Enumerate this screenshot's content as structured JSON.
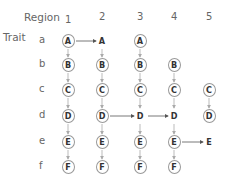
{
  "header": {
    "region_label": "Region",
    "trait_label": "Trait"
  },
  "regions": [
    {
      "label": "1",
      "x": 68
    },
    {
      "label": "2",
      "x": 102
    },
    {
      "label": "3",
      "x": 140
    },
    {
      "label": "4",
      "x": 174
    },
    {
      "label": "5",
      "x": 209
    }
  ],
  "traits": [
    {
      "label": "a",
      "y": 41
    },
    {
      "label": "b",
      "y": 65
    },
    {
      "label": "c",
      "y": 90
    },
    {
      "label": "d",
      "y": 116
    },
    {
      "label": "e",
      "y": 142
    },
    {
      "label": "f",
      "y": 167
    }
  ],
  "nodes": [
    {
      "id": "a1",
      "text": "A",
      "col": 0,
      "row": 0,
      "circled": true
    },
    {
      "id": "a2",
      "text": "A",
      "col": 1,
      "row": 0,
      "circled": false
    },
    {
      "id": "a3",
      "text": "A",
      "col": 2,
      "row": 0,
      "circled": true
    },
    {
      "id": "b1",
      "text": "B",
      "col": 0,
      "row": 1,
      "circled": true
    },
    {
      "id": "b2",
      "text": "B",
      "col": 1,
      "row": 1,
      "circled": true
    },
    {
      "id": "b3",
      "text": "B",
      "col": 2,
      "row": 1,
      "circled": true
    },
    {
      "id": "b4",
      "text": "B",
      "col": 3,
      "row": 1,
      "circled": true
    },
    {
      "id": "c1",
      "text": "C",
      "col": 0,
      "row": 2,
      "circled": true
    },
    {
      "id": "c2",
      "text": "C",
      "col": 1,
      "row": 2,
      "circled": true
    },
    {
      "id": "c3",
      "text": "C",
      "col": 2,
      "row": 2,
      "circled": true
    },
    {
      "id": "c4",
      "text": "C",
      "col": 3,
      "row": 2,
      "circled": true
    },
    {
      "id": "c5",
      "text": "C",
      "col": 4,
      "row": 2,
      "circled": true
    },
    {
      "id": "d1",
      "text": "D",
      "col": 0,
      "row": 3,
      "circled": true
    },
    {
      "id": "d2",
      "text": "D",
      "col": 1,
      "row": 3,
      "circled": true
    },
    {
      "id": "d3",
      "text": "D",
      "col": 2,
      "row": 3,
      "circled": false
    },
    {
      "id": "d4",
      "text": "D",
      "col": 3,
      "row": 3,
      "circled": false
    },
    {
      "id": "d5",
      "text": "D",
      "col": 4,
      "row": 3,
      "circled": true
    },
    {
      "id": "e1",
      "text": "E",
      "col": 0,
      "row": 4,
      "circled": true
    },
    {
      "id": "e2",
      "text": "E",
      "col": 1,
      "row": 4,
      "circled": true
    },
    {
      "id": "e3",
      "text": "E",
      "col": 2,
      "row": 4,
      "circled": true
    },
    {
      "id": "e4",
      "text": "E",
      "col": 3,
      "row": 4,
      "circled": true
    },
    {
      "id": "e5",
      "text": "E",
      "col": 4,
      "row": 4,
      "circled": false
    },
    {
      "id": "f1",
      "text": "F",
      "col": 0,
      "row": 5,
      "circled": true
    },
    {
      "id": "f2",
      "text": "F",
      "col": 1,
      "row": 5,
      "circled": true
    },
    {
      "id": "f3",
      "text": "F",
      "col": 2,
      "row": 5,
      "circled": true
    },
    {
      "id": "f4",
      "text": "F",
      "col": 3,
      "row": 5,
      "circled": true
    }
  ],
  "edges": [
    {
      "from": "a1",
      "to": "a2",
      "dir": "h",
      "style": "dark"
    },
    {
      "from": "d2",
      "to": "d3",
      "dir": "h",
      "style": "dark"
    },
    {
      "from": "d3",
      "to": "d4",
      "dir": "h",
      "style": "dark"
    },
    {
      "from": "e4",
      "to": "e5",
      "dir": "h",
      "style": "dark"
    },
    {
      "from": "a1",
      "to": "b1",
      "dir": "v",
      "style": "light"
    },
    {
      "from": "b1",
      "to": "c1",
      "dir": "v",
      "style": "light"
    },
    {
      "from": "c1",
      "to": "d1",
      "dir": "v",
      "style": "light"
    },
    {
      "from": "d1",
      "to": "e1",
      "dir": "v",
      "style": "light"
    },
    {
      "from": "e1",
      "to": "f1",
      "dir": "v",
      "style": "light"
    },
    {
      "from": "a2",
      "to": "b2",
      "dir": "v",
      "style": "light"
    },
    {
      "from": "b2",
      "to": "c2",
      "dir": "v",
      "style": "light"
    },
    {
      "from": "c2",
      "to": "d2",
      "dir": "v",
      "style": "light"
    },
    {
      "from": "d2",
      "to": "e2",
      "dir": "v",
      "style": "light"
    },
    {
      "from": "e2",
      "to": "f2",
      "dir": "v",
      "style": "light"
    },
    {
      "from": "a3",
      "to": "b3",
      "dir": "v",
      "style": "light"
    },
    {
      "from": "b3",
      "to": "c3",
      "dir": "v",
      "style": "light"
    },
    {
      "from": "c3",
      "to": "d3",
      "dir": "v",
      "style": "light"
    },
    {
      "from": "d3",
      "to": "e3",
      "dir": "v",
      "style": "light"
    },
    {
      "from": "e3",
      "to": "f3",
      "dir": "v",
      "style": "light"
    },
    {
      "from": "b4",
      "to": "c4",
      "dir": "v",
      "style": "light"
    },
    {
      "from": "c4",
      "to": "d4",
      "dir": "v",
      "style": "light"
    },
    {
      "from": "d4",
      "to": "e4",
      "dir": "v",
      "style": "light"
    },
    {
      "from": "e4",
      "to": "f4",
      "dir": "v",
      "style": "light"
    },
    {
      "from": "c5",
      "to": "d5",
      "dir": "v",
      "style": "light"
    }
  ],
  "colors": {
    "dark_arrow": "#555555",
    "light_arrow": "#aaaaaa",
    "circle": "#999999",
    "text": "#333333"
  }
}
